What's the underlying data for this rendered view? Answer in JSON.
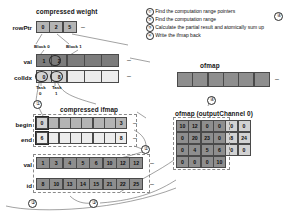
{
  "figure": {
    "compressed_weight": {
      "title": "compressed weight",
      "rows": [
        {
          "label": "rowPtr",
          "cells": [
            "0",
            "2",
            "5"
          ],
          "trailing": "–"
        },
        {
          "label": "val",
          "cells": [
            "1",
            "2",
            "",
            "",
            ""
          ],
          "trailing": "–"
        },
        {
          "label": "colIdx",
          "cells": [
            "0",
            "8",
            "",
            "",
            ""
          ],
          "trailing": "–"
        }
      ],
      "blocks": [
        "Block 0",
        "Block 1"
      ],
      "tasks": [
        {
          "name": "Task",
          "index": "0"
        },
        {
          "name": "Task",
          "index": "1"
        }
      ]
    },
    "compressed_ifmap": {
      "title": "compressed ifmap",
      "rows": [
        {
          "label": "begin",
          "cells": [
            "0",
            "",
            "",
            "",
            "",
            "",
            "",
            "3"
          ],
          "trailing": "–"
        },
        {
          "label": "end",
          "cells": [
            "6",
            "",
            "",
            "",
            "",
            "",
            "",
            "8"
          ],
          "trailing": "–"
        },
        {
          "label": "val",
          "cells": [
            "1",
            "3",
            "4",
            "5",
            "6",
            "10",
            "12",
            "12"
          ],
          "trailing": "–"
        },
        {
          "label": "id",
          "cells": [
            "8",
            "10",
            "13",
            "14",
            "15",
            "21",
            "22",
            "25"
          ],
          "trailing": "–"
        }
      ]
    },
    "ofmap": {
      "title": "ofmap",
      "cells": [
        "",
        "",
        "",
        "",
        "",
        ""
      ],
      "trailing": "–"
    },
    "ofmap_grid": {
      "title": "ofmap (outputChannel 0)",
      "rows": [
        [
          "10",
          "12",
          "0",
          "0",
          "0",
          "0"
        ],
        [
          "0",
          "20",
          "23",
          "0",
          "8",
          "24"
        ],
        [
          "0",
          "4",
          "5",
          "6",
          "0",
          "0"
        ],
        [
          "0",
          "0",
          "0",
          "10",
          "",
          ""
        ]
      ]
    },
    "legend": {
      "items": [
        {
          "num": "①",
          "text": "Find the computation range pointers"
        },
        {
          "num": "②",
          "text": "Find the computation range"
        },
        {
          "num": "③",
          "text": "Calculate the partial result and atomically sum up"
        },
        {
          "num": "④",
          "text": "Write the ifmap back"
        }
      ]
    },
    "step_markers": [
      {
        "id": "marker-1",
        "label": "①"
      },
      {
        "id": "marker-2",
        "label": "②"
      },
      {
        "id": "marker-3",
        "label": "③"
      },
      {
        "id": "marker-4",
        "label": "④"
      },
      {
        "id": "marker-3b",
        "label": "③"
      },
      {
        "id": "marker-4b",
        "label": "④"
      }
    ]
  }
}
